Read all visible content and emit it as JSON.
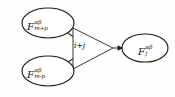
{
  "diagram": {
    "type": "flow-graph",
    "background_color": "#fefefe",
    "stroke_color": "#1a1a1a",
    "nodes": [
      {
        "id": "node-top-left",
        "shape": "ellipse",
        "label_base": "F",
        "label_superscript": "αβ",
        "label_subscript": "m+p",
        "cx": 48,
        "cy": 23,
        "rx": 26,
        "ry": 15
      },
      {
        "id": "node-bottom-left",
        "shape": "ellipse",
        "label_base": "F",
        "label_superscript": "αβ",
        "label_subscript": "m-p",
        "cx": 48,
        "cy": 71,
        "rx": 26,
        "ry": 15
      },
      {
        "id": "node-right",
        "shape": "ellipse",
        "label_base": "F",
        "label_superscript": "αβ",
        "label_subscript": "j",
        "cx": 145,
        "cy": 48,
        "rx": 23,
        "ry": 14
      }
    ],
    "operator": {
      "id": "operator-triangle",
      "shape": "triangle-right",
      "label": "i+j",
      "apex_x": 113,
      "apex_y": 48,
      "left_x": 73,
      "top_y": 28,
      "bottom_y": 69
    },
    "edges": [
      {
        "id": "edge-top-in",
        "from": "node-top-left",
        "to": "operator-triangle",
        "arrow": "end"
      },
      {
        "id": "edge-bottom-in",
        "from": "node-bottom-left",
        "to": "operator-triangle",
        "arrow": "end"
      },
      {
        "id": "edge-out",
        "from": "operator-triangle",
        "to": "node-right",
        "arrow": "end"
      }
    ]
  }
}
